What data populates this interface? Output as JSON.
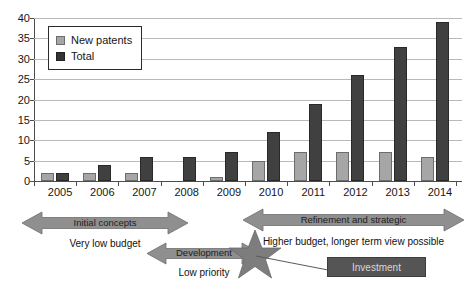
{
  "chart_data": {
    "type": "bar",
    "title": "",
    "xlabel": "",
    "ylabel": "",
    "ylim": [
      0,
      40
    ],
    "ytick_step": 5,
    "grid": true,
    "legend_position": "top-left",
    "categories": [
      "2005",
      "2006",
      "2007",
      "2008",
      "2009",
      "2010",
      "2011",
      "2012",
      "2013",
      "2014"
    ],
    "series": [
      {
        "name": "New patents",
        "color": "#a6a6a6",
        "values": [
          2,
          2,
          2,
          0,
          1,
          5,
          7,
          7,
          7,
          6
        ]
      },
      {
        "name": "Total",
        "color": "#404040",
        "values": [
          2,
          4,
          6,
          6,
          7,
          12,
          19,
          26,
          33,
          39
        ]
      }
    ],
    "yticks": [
      "0",
      "5",
      "10",
      "15",
      "20",
      "25",
      "30",
      "35",
      "40"
    ]
  },
  "legend": {
    "items": [
      {
        "label": "New patents",
        "color": "#a6a6a6"
      },
      {
        "label": "Total",
        "color": "#333333"
      }
    ]
  },
  "annotations": {
    "phase_initial": {
      "label": "Initial concepts",
      "sub": "Very low budget",
      "color": "#8c8c8c"
    },
    "phase_development": {
      "label": "Development",
      "sub": "Low priority",
      "color": "#8c8c8c"
    },
    "phase_refinement": {
      "label": "Refinement and strategic",
      "sub": "Higher budget, longer term view possible",
      "color": "#8c8c8c"
    },
    "investment": {
      "label": "Investment",
      "box_color": "#555555",
      "star_color": "#777777"
    }
  }
}
